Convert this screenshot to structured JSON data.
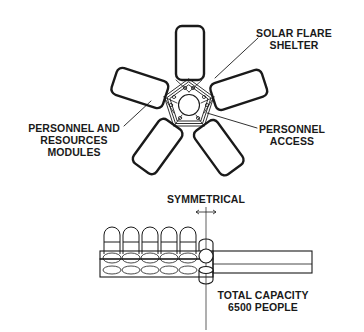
{
  "diagram": {
    "top_view": {
      "labels": {
        "solar_flare_shelter": [
          "SOLAR FLARE",
          "SHELTER"
        ],
        "personnel_resources_modules": [
          "PERSONNEL AND",
          "RESOURCES",
          "MODULES"
        ],
        "personnel_access": [
          "PERSONNEL",
          "ACCESS"
        ]
      },
      "module_count": 5
    },
    "side_view": {
      "labels": {
        "symmetrical": "SYMMETRICAL",
        "total_capacity": [
          "TOTAL CAPACITY",
          "6500 PEOPLE"
        ]
      },
      "stacked_module_count": 5
    },
    "colors": {
      "line": "#1a1a1a",
      "background": "#ffffff"
    }
  }
}
